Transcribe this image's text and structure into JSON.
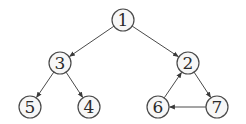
{
  "diagram": {
    "type": "directed-graph",
    "colors": {
      "stroke": "#4a4a4a",
      "node_fill": "#f7f7f7",
      "label": "#2a2a2a"
    },
    "node_radius": 11,
    "nodes": [
      {
        "id": "1",
        "label": "1",
        "x": 123,
        "y": 20
      },
      {
        "id": "3",
        "label": "3",
        "x": 60,
        "y": 63
      },
      {
        "id": "2",
        "label": "2",
        "x": 188,
        "y": 63
      },
      {
        "id": "5",
        "label": "5",
        "x": 30,
        "y": 107
      },
      {
        "id": "4",
        "label": "4",
        "x": 89,
        "y": 107
      },
      {
        "id": "6",
        "label": "6",
        "x": 158,
        "y": 107
      },
      {
        "id": "7",
        "label": "7",
        "x": 217,
        "y": 107
      }
    ],
    "edges": [
      {
        "from": "1",
        "to": "3"
      },
      {
        "from": "1",
        "to": "2"
      },
      {
        "from": "3",
        "to": "5"
      },
      {
        "from": "3",
        "to": "4"
      },
      {
        "from": "2",
        "to": "7"
      },
      {
        "from": "7",
        "to": "6"
      },
      {
        "from": "6",
        "to": "2"
      }
    ]
  }
}
